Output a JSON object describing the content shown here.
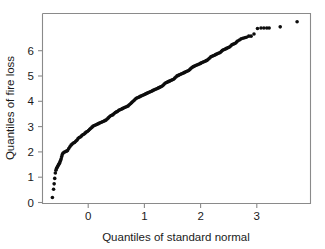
{
  "chart_data": {
    "type": "scatter",
    "title": "",
    "subtitle": "",
    "xlabel": "Quantiles of standard normal",
    "ylabel": "Quantiles of fire loss",
    "xlim": [
      -0.75,
      3.85
    ],
    "ylim": [
      -0.22,
      6.75
    ],
    "xticks": [
      0,
      1,
      2,
      3
    ],
    "xticklabels": [
      "0",
      "1",
      "2",
      "3"
    ],
    "yticks": [
      0,
      1,
      2,
      3,
      4,
      5,
      6
    ],
    "yticklabels": [
      "0",
      "1",
      "2",
      "3",
      "4",
      "5",
      "6"
    ],
    "grid": false,
    "legend": null,
    "marker": "filled-circle",
    "marker_color": "#0d0d0d",
    "marker_size_px": 2.5,
    "annotations": [],
    "series": [
      {
        "name": "fire loss quantiles",
        "x": [
          -0.58,
          -0.56,
          -0.55,
          -0.54,
          -0.53,
          -0.52,
          -0.51,
          -0.5,
          -0.49,
          -0.48,
          -0.47,
          -0.46,
          -0.45,
          -0.44,
          -0.43,
          -0.42,
          -0.41,
          -0.4,
          -0.38,
          -0.36,
          -0.34,
          -0.32,
          -0.3,
          -0.28,
          -0.26,
          -0.24,
          -0.22,
          -0.2,
          -0.18,
          -0.16,
          -0.14,
          -0.12,
          -0.1,
          -0.08,
          -0.06,
          -0.04,
          -0.02,
          0.0,
          0.02,
          0.04,
          0.06,
          0.08,
          0.1,
          0.12,
          0.14,
          0.16,
          0.18,
          0.2,
          0.22,
          0.24,
          0.26,
          0.28,
          0.3,
          0.32,
          0.34,
          0.36,
          0.38,
          0.4,
          0.42,
          0.44,
          0.46,
          0.48,
          0.5,
          0.52,
          0.54,
          0.56,
          0.58,
          0.6,
          0.62,
          0.64,
          0.66,
          0.68,
          0.7,
          0.72,
          0.74,
          0.76,
          0.78,
          0.8,
          0.82,
          0.84,
          0.86,
          0.88,
          0.9,
          0.92,
          0.94,
          0.96,
          0.98,
          1.0,
          1.02,
          1.04,
          1.06,
          1.08,
          1.1,
          1.12,
          1.14,
          1.16,
          1.18,
          1.2,
          1.22,
          1.24,
          1.26,
          1.28,
          1.3,
          1.32,
          1.34,
          1.36,
          1.38,
          1.4,
          1.42,
          1.44,
          1.46,
          1.48,
          1.5,
          1.52,
          1.54,
          1.56,
          1.58,
          1.6,
          1.62,
          1.64,
          1.66,
          1.68,
          1.7,
          1.72,
          1.74,
          1.76,
          1.78,
          1.8,
          1.82,
          1.84,
          1.86,
          1.88,
          1.9,
          1.92,
          1.94,
          1.96,
          1.98,
          2.0,
          2.02,
          2.04,
          2.06,
          2.08,
          2.1,
          2.12,
          2.14,
          2.16,
          2.18,
          2.2,
          2.22,
          2.24,
          2.26,
          2.28,
          2.3,
          2.32,
          2.34,
          2.36,
          2.38,
          2.4,
          2.42,
          2.44,
          2.46,
          2.48,
          2.5,
          2.52,
          2.54,
          2.56,
          2.58,
          2.6,
          2.63,
          2.66,
          2.69,
          2.72,
          2.75,
          2.79,
          2.83,
          2.88,
          2.94,
          3.0,
          3.05,
          3.1,
          3.14,
          3.33,
          3.62
        ],
        "y": [
          0.0,
          0.3,
          0.5,
          0.7,
          0.9,
          1.0,
          1.06,
          1.1,
          1.14,
          1.18,
          1.22,
          1.26,
          1.3,
          1.36,
          1.42,
          1.5,
          1.58,
          1.62,
          1.66,
          1.68,
          1.7,
          1.72,
          1.8,
          1.86,
          1.92,
          1.96,
          2.0,
          2.02,
          2.06,
          2.1,
          2.16,
          2.2,
          2.22,
          2.26,
          2.3,
          2.32,
          2.36,
          2.4,
          2.42,
          2.46,
          2.5,
          2.54,
          2.58,
          2.62,
          2.64,
          2.66,
          2.68,
          2.7,
          2.72,
          2.74,
          2.76,
          2.78,
          2.8,
          2.82,
          2.84,
          2.88,
          2.92,
          2.96,
          3.0,
          3.02,
          3.04,
          3.08,
          3.12,
          3.14,
          3.16,
          3.2,
          3.22,
          3.24,
          3.26,
          3.28,
          3.3,
          3.32,
          3.34,
          3.36,
          3.4,
          3.44,
          3.48,
          3.52,
          3.56,
          3.6,
          3.64,
          3.66,
          3.68,
          3.7,
          3.72,
          3.74,
          3.76,
          3.78,
          3.8,
          3.82,
          3.84,
          3.86,
          3.88,
          3.9,
          3.92,
          3.94,
          3.96,
          3.98,
          4.0,
          4.02,
          4.04,
          4.06,
          4.08,
          4.12,
          4.16,
          4.2,
          4.22,
          4.24,
          4.26,
          4.28,
          4.3,
          4.32,
          4.34,
          4.38,
          4.42,
          4.46,
          4.48,
          4.5,
          4.52,
          4.54,
          4.56,
          4.58,
          4.6,
          4.62,
          4.64,
          4.66,
          4.7,
          4.74,
          4.78,
          4.8,
          4.82,
          4.84,
          4.86,
          4.88,
          4.9,
          4.92,
          4.94,
          4.96,
          4.98,
          5.0,
          5.02,
          5.04,
          5.08,
          5.12,
          5.16,
          5.18,
          5.2,
          5.22,
          5.24,
          5.26,
          5.28,
          5.3,
          5.32,
          5.36,
          5.4,
          5.42,
          5.44,
          5.46,
          5.48,
          5.5,
          5.52,
          5.56,
          5.6,
          5.62,
          5.64,
          5.66,
          5.7,
          5.74,
          5.78,
          5.82,
          5.84,
          5.86,
          5.88,
          5.92,
          5.92,
          6.0,
          6.2,
          6.22,
          6.22,
          6.22,
          6.22,
          6.26,
          6.45
        ]
      }
    ]
  },
  "axes": {
    "x_title": "Quantiles of standard normal",
    "y_title": "Quantiles of fire loss",
    "x_tick_labels": [
      "0",
      "1",
      "2",
      "3"
    ],
    "y_tick_labels": [
      "0",
      "1",
      "2",
      "3",
      "4",
      "5",
      "6"
    ]
  },
  "colors": {
    "background": "#ffffff",
    "frame": "#8a8a8a",
    "marker": "#0d0d0d",
    "text": "#1a1a1a"
  }
}
